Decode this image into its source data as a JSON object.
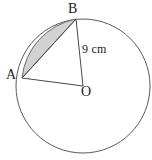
{
  "figure": {
    "type": "geometry-diagram",
    "labels": {
      "point_a": "A",
      "point_b": "B",
      "centre": "O",
      "radius": "9 cm"
    },
    "colors": {
      "stroke": "#555555",
      "shading": "#d2d2d2",
      "shading_stroke": "#6b6b6b",
      "text": "#1a1a1a",
      "background": "#ffffff"
    },
    "geometry": {
      "circle_center_x": 83,
      "circle_center_y": 86,
      "circle_radius": 67,
      "point_a_x": 22,
      "point_a_y": 78,
      "point_b_x": 76,
      "point_b_y": 19,
      "radius_value": 9,
      "radius_unit": "cm"
    }
  }
}
